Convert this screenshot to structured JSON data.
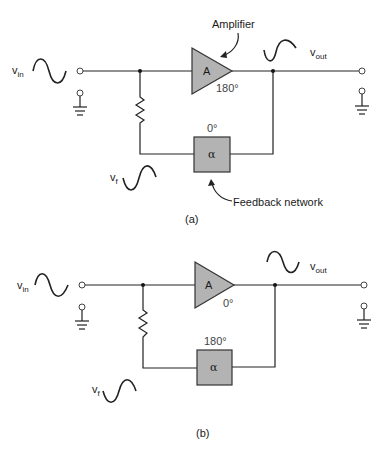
{
  "figure": {
    "panels": [
      {
        "id": "a",
        "caption": "(a)",
        "input_label": "v",
        "input_sub": "in",
        "output_label": "v",
        "output_sub": "out",
        "feedback_label": "v",
        "feedback_sub": "f",
        "amplifier_symbol": "A",
        "amplifier_phase": "180°",
        "feedback_symbol": "α",
        "feedback_phase": "0°",
        "callout_amplifier": "Amplifier",
        "callout_feedback": "Feedback network"
      },
      {
        "id": "b",
        "caption": "(b)",
        "input_label": "v",
        "input_sub": "in",
        "output_label": "v",
        "output_sub": "out",
        "feedback_label": "v",
        "feedback_sub": "f",
        "amplifier_symbol": "A",
        "amplifier_phase": "0°",
        "feedback_symbol": "α",
        "feedback_phase": "180°"
      }
    ],
    "colors": {
      "block_fill": "#b3b3b3",
      "line": "#222222",
      "background": "#ffffff"
    }
  }
}
